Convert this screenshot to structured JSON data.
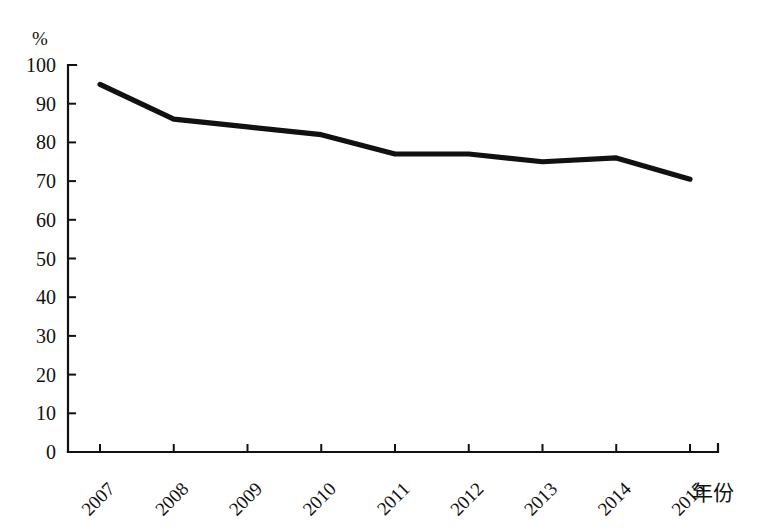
{
  "chart_data": {
    "type": "line",
    "title": "",
    "subtitle": "",
    "xlabel": "年份",
    "ylabel": "%",
    "categories": [
      "2007",
      "2008",
      "2009",
      "2010",
      "2011",
      "2012",
      "2013",
      "2014",
      "2015"
    ],
    "x": [
      2007,
      2008,
      2009,
      2010,
      2011,
      2012,
      2013,
      2014,
      2015
    ],
    "series": [
      {
        "name": "",
        "values": [
          95,
          86,
          84,
          82,
          77,
          77,
          75,
          76,
          70.5
        ]
      }
    ],
    "values": [
      95,
      86,
      84,
      82,
      77,
      77,
      75,
      76,
      70.5
    ],
    "ylim": [
      0,
      100
    ],
    "y_ticks": [
      0,
      10,
      20,
      30,
      40,
      50,
      60,
      70,
      80,
      90,
      100
    ],
    "y_tick_labels": [
      "0",
      "10",
      "20",
      "30",
      "40",
      "50",
      "60",
      "70",
      "80",
      "90",
      "100"
    ],
    "grid": false,
    "legend": false,
    "legend_position": "none",
    "line_color": "#111111",
    "background_color": "#ffffff",
    "x_tick_label_rotation": -45
  },
  "axes": {
    "y_unit_label": "%",
    "x_axis_title": "年份"
  },
  "ticks": {
    "y": [
      {
        "label": "100",
        "value": 100
      },
      {
        "label": "90",
        "value": 90
      },
      {
        "label": "80",
        "value": 80
      },
      {
        "label": "70",
        "value": 70
      },
      {
        "label": "60",
        "value": 60
      },
      {
        "label": "50",
        "value": 50
      },
      {
        "label": "40",
        "value": 40
      },
      {
        "label": "30",
        "value": 30
      },
      {
        "label": "20",
        "value": 20
      },
      {
        "label": "10",
        "value": 10
      },
      {
        "label": "0",
        "value": 0
      }
    ],
    "x": [
      {
        "label": "2007",
        "value": 2007
      },
      {
        "label": "2008",
        "value": 2008
      },
      {
        "label": "2009",
        "value": 2009
      },
      {
        "label": "2010",
        "value": 2010
      },
      {
        "label": "2011",
        "value": 2011
      },
      {
        "label": "2012",
        "value": 2012
      },
      {
        "label": "2013",
        "value": 2013
      },
      {
        "label": "2014",
        "value": 2014
      },
      {
        "label": "2015",
        "value": 2015
      }
    ]
  }
}
